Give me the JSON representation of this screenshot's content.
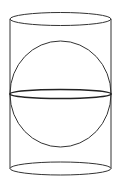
{
  "diagram": {
    "title": "",
    "stroke_color": "#333333",
    "background": "#ffffff",
    "cylinder": {
      "left_x": 10,
      "right_x": 111,
      "top_y": 19,
      "bottom_y": 168,
      "ellipse_ry": 6.5
    },
    "sphere": {
      "cx": 60.5,
      "cy": 94,
      "rx": 50.5,
      "ry": 53,
      "equator_ry": 5
    }
  }
}
